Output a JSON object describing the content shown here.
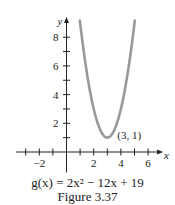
{
  "chart_data": {
    "type": "line",
    "title": "",
    "function": "g(x) = 2x^2 - 12x + 19",
    "coefficients": {
      "a": 2,
      "b": -12,
      "c": 19
    },
    "xlabel": "x",
    "ylabel": "y",
    "xlim": [
      -3.7,
      7.1
    ],
    "ylim": [
      -1,
      9.2
    ],
    "x_ticks": [
      -3,
      -2,
      -1,
      1,
      2,
      3,
      4,
      5,
      6
    ],
    "x_tick_labels": [
      {
        "value": -2,
        "label": "−2"
      },
      {
        "value": 2,
        "label": "2"
      },
      {
        "value": 4,
        "label": "4"
      },
      {
        "value": 6,
        "label": "6"
      }
    ],
    "y_ticks": [
      1,
      2,
      3,
      4,
      5,
      6,
      7,
      8
    ],
    "y_tick_labels": [
      {
        "value": 2,
        "label": "2"
      },
      {
        "value": 4,
        "label": "4"
      },
      {
        "value": 6,
        "label": "6"
      },
      {
        "value": 8,
        "label": "8"
      }
    ],
    "curve_domain": [
      0.98,
      5.02
    ],
    "series": [
      {
        "name": "g(x)",
        "color": "#999999"
      }
    ],
    "annotations": [
      {
        "x": 3,
        "y": 1,
        "text": "(3, 1)",
        "type": "vertex"
      }
    ],
    "grid": false,
    "legend": "none"
  },
  "caption": {
    "formula_prefix": "g",
    "formula_arg": "(x)",
    "formula_text": "g(x) = 2x² − 12x + 19",
    "figure_label": "Figure 3.37"
  },
  "colors": {
    "axis": "#222222",
    "curve": "#999999",
    "text": "#222222"
  }
}
